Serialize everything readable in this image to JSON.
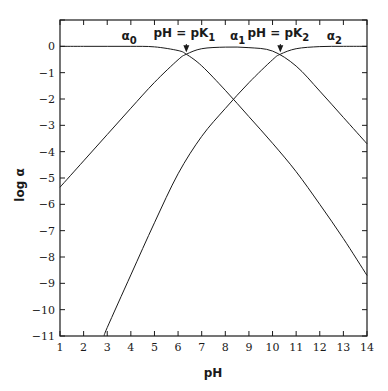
{
  "chart_data": {
    "type": "line",
    "title": "",
    "xlabel": "pH",
    "ylabel": "log α",
    "xlim": [
      1,
      14
    ],
    "ylim": [
      -11,
      1
    ],
    "grid": false,
    "legend": "none (curves labeled inline)",
    "x_ticks": [
      "1",
      "2",
      "3",
      "4",
      "5",
      "6",
      "7",
      "8",
      "9",
      "10",
      "11",
      "12",
      "13",
      "14"
    ],
    "y_ticks": [
      "0",
      "-1",
      "-2",
      "-3",
      "-4",
      "-5",
      "-6",
      "-7",
      "-8",
      "-9",
      "-10",
      "-11"
    ],
    "pK1": 6.35,
    "pK2": 10.33,
    "series": [
      {
        "name": "α0",
        "label_main": "α",
        "label_sub": "0",
        "label_pos": {
          "x": 3.6,
          "y": 0.25
        },
        "x": [
          1,
          2,
          3,
          4,
          5,
          6,
          6.35,
          7,
          8,
          9,
          10,
          11,
          12,
          13,
          14
        ],
        "values": [
          0,
          0,
          0,
          0,
          -0.02,
          -0.16,
          -0.3,
          -0.74,
          -1.67,
          -2.67,
          -3.68,
          -4.76,
          -6.0,
          -7.3,
          -8.7
        ]
      },
      {
        "name": "α1",
        "label_main": "α",
        "label_sub": "1",
        "label_pos": {
          "x": 8.2,
          "y": 0.25
        },
        "x": [
          1,
          2,
          3,
          4,
          5,
          6,
          6.35,
          7,
          8,
          9,
          10,
          11,
          12,
          13,
          14
        ],
        "values": [
          -5.35,
          -4.35,
          -3.35,
          -2.35,
          -1.37,
          -0.51,
          -0.3,
          -0.09,
          -0.03,
          -0.05,
          -0.18,
          -0.75,
          -1.7,
          -2.7,
          -3.7
        ]
      },
      {
        "name": "α2",
        "label_main": "α",
        "label_sub": "2",
        "label_pos": {
          "x": 12.3,
          "y": 0.25
        },
        "x": [
          2.87,
          3,
          4,
          5,
          6,
          7,
          8,
          9,
          10,
          10.33,
          11,
          12,
          13,
          14
        ],
        "values": [
          -11,
          -10.68,
          -8.68,
          -6.7,
          -4.84,
          -3.42,
          -2.36,
          -1.38,
          -0.51,
          -0.3,
          -0.09,
          -0.01,
          0,
          0
        ]
      }
    ],
    "annotations": [
      {
        "text": "pH = pK",
        "sub": "1",
        "x": 6.35,
        "arrow_to_y": -0.3
      },
      {
        "text": "pH = pK",
        "sub": "2",
        "x": 10.33,
        "arrow_to_y": -0.3
      }
    ]
  }
}
